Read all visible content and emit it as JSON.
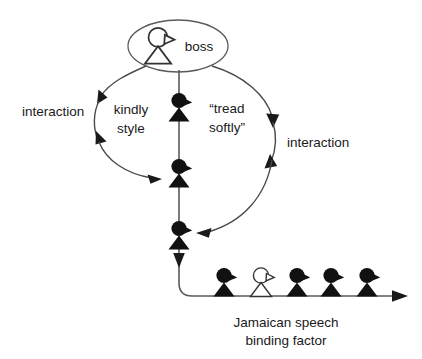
{
  "diagram": {
    "type": "concept-diagram",
    "background_color": "#ffffff",
    "line_color": "#5a5a5a",
    "figure_dark_color": "#111111",
    "figure_light_color": "#ffffff",
    "text_color": "#1a1a1a",
    "node": {
      "boss_label": "boss",
      "boss_figure_style": "outline"
    },
    "labels": {
      "interaction_left": "interaction",
      "kindly_style_line1": "kindly",
      "kindly_style_line2": "style",
      "tread_softly_line1": "“tread",
      "tread_softly_line2": "softly”",
      "interaction_right": "interaction",
      "axis_line1": "Jamaican speech",
      "axis_line2": "binding factor"
    },
    "vertical_chain_figures": [
      {
        "index": 1,
        "style": "dark"
      },
      {
        "index": 2,
        "style": "dark"
      },
      {
        "index": 3,
        "style": "dark"
      }
    ],
    "axis_figures": [
      {
        "index": 1,
        "style": "dark"
      },
      {
        "index": 2,
        "style": "light"
      },
      {
        "index": 3,
        "style": "dark"
      },
      {
        "index": 4,
        "style": "dark"
      },
      {
        "index": 5,
        "style": "dark"
      }
    ],
    "arrows": {
      "left_arc_heads": 3,
      "right_arc_heads": 3,
      "vertical_head": 1,
      "axis_head": 1
    }
  }
}
